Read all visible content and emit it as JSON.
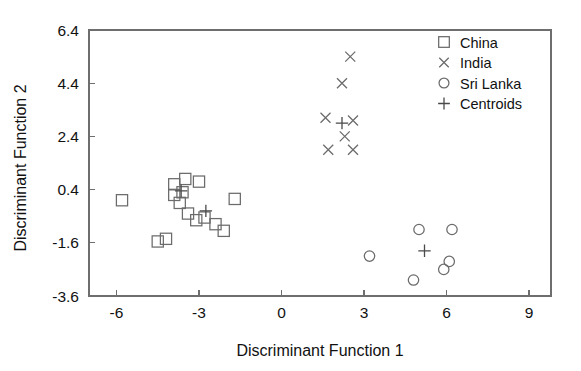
{
  "chart_data": {
    "type": "scatter",
    "title": "",
    "xlabel": "Discriminant Function 1",
    "ylabel": "Discriminant Function 2",
    "xlim": [
      -7.0,
      9.8
    ],
    "ylim": [
      -3.6,
      6.4
    ],
    "xticks": [
      -6,
      -3,
      0,
      3,
      6,
      9
    ],
    "xtick_labels": [
      "-6",
      "-3",
      "0",
      "3",
      "6",
      "9"
    ],
    "yticks": [
      -3.6,
      -1.6,
      0.4,
      2.4,
      4.4,
      6.4
    ],
    "ytick_labels": [
      "-3.6",
      "-1.6",
      "0.4",
      "2.4",
      "4.4",
      "6.4"
    ],
    "grid": false,
    "legend_position": "top-right",
    "series": [
      {
        "name": "China",
        "marker": "square",
        "points": [
          [
            -5.8,
            0.0
          ],
          [
            -3.9,
            0.6
          ],
          [
            -3.5,
            0.8
          ],
          [
            -3.0,
            0.7
          ],
          [
            -3.9,
            0.2
          ],
          [
            -3.6,
            0.3
          ],
          [
            -3.7,
            -0.1
          ],
          [
            -3.4,
            -0.5
          ],
          [
            -3.1,
            -0.75
          ],
          [
            -2.8,
            -0.65
          ],
          [
            -2.4,
            -0.9
          ],
          [
            -2.1,
            -1.15
          ],
          [
            -4.5,
            -1.55
          ],
          [
            -4.2,
            -1.45
          ],
          [
            -1.7,
            0.05
          ]
        ]
      },
      {
        "name": "India",
        "marker": "cross",
        "points": [
          [
            2.5,
            5.4
          ],
          [
            2.2,
            4.4
          ],
          [
            1.6,
            3.1
          ],
          [
            2.6,
            3.0
          ],
          [
            2.3,
            2.4
          ],
          [
            1.7,
            1.9
          ],
          [
            2.6,
            1.9
          ]
        ]
      },
      {
        "name": "Sri Lanka",
        "marker": "circle",
        "points": [
          [
            5.0,
            -1.1
          ],
          [
            6.2,
            -1.1
          ],
          [
            3.2,
            -2.1
          ],
          [
            6.1,
            -2.3
          ],
          [
            5.9,
            -2.6
          ],
          [
            4.8,
            -3.0
          ]
        ]
      },
      {
        "name": "Centroids",
        "marker": "plus",
        "points": [
          [
            -3.65,
            0.35
          ],
          [
            -2.75,
            -0.4
          ],
          [
            2.2,
            2.9
          ],
          [
            5.2,
            -1.9
          ]
        ]
      }
    ],
    "legend": [
      {
        "label": "China",
        "marker": "square"
      },
      {
        "label": "India",
        "marker": "cross"
      },
      {
        "label": "Sri Lanka",
        "marker": "circle"
      },
      {
        "label": "Centroids",
        "marker": "plus"
      }
    ],
    "colors": {
      "axis": "#6e6e6e",
      "marker": "#6b6b6b",
      "text": "#111111",
      "background": "#ffffff"
    }
  }
}
